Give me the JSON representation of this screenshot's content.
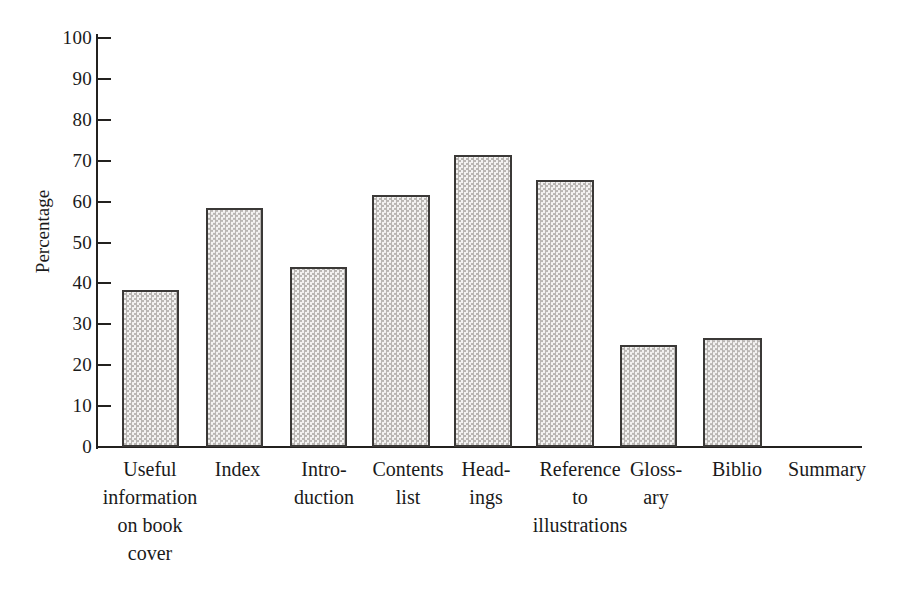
{
  "chart_data": {
    "type": "bar",
    "title": "",
    "xlabel": "",
    "ylabel": "Percentage",
    "ylim": [
      0,
      100
    ],
    "ytick_values": [
      100,
      90,
      80,
      70,
      60,
      50,
      40,
      30,
      20,
      10,
      0
    ],
    "ytick_labels": [
      "100",
      "90",
      "80",
      "70",
      "60",
      "50",
      "40",
      "30",
      "20",
      "10",
      "0"
    ],
    "grid": false,
    "legend": "none",
    "categories": [
      "Useful information on book cover",
      "Index",
      "Introduction",
      "Contents list",
      "Headings",
      "Reference to illustrations",
      "Glossary",
      "Biblio",
      "Summary"
    ],
    "category_label_lines": [
      [
        "Useful",
        "information",
        "on book",
        "cover"
      ],
      [
        "Index"
      ],
      [
        "Intro-",
        "duction"
      ],
      [
        "Contents",
        "list"
      ],
      [
        "Head-",
        "ings"
      ],
      [
        "Reference",
        "to",
        "illustrations"
      ],
      [
        "Gloss-",
        "ary"
      ],
      [
        "Biblio"
      ],
      [
        "Summary"
      ]
    ],
    "values": [
      38.4,
      58.4,
      44.0,
      61.6,
      71.4,
      65.3,
      24.9,
      26.7,
      0
    ],
    "bar_fill_color": "#eceaea",
    "bar_pattern_color": "#b9b6b3",
    "bar_border_color": "#3b3937",
    "axis_color": "#23211f",
    "background_color": "#ffffff"
  },
  "layout": {
    "bar_left_px": [
      122,
      206,
      290,
      372,
      454,
      536,
      620,
      703,
      787
    ],
    "bar_width_px": [
      57,
      57,
      57,
      58,
      58,
      58,
      57,
      59,
      0
    ],
    "label_left_px": [
      95,
      190,
      275,
      358,
      440,
      520,
      610,
      692,
      772
    ],
    "label_width_px": [
      110,
      95,
      98,
      100,
      92,
      120,
      92,
      90,
      110
    ]
  }
}
